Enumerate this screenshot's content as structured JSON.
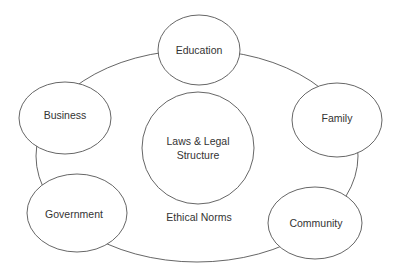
{
  "diagram": {
    "outer_label": "Ethical Norms",
    "center": {
      "line1": "Laws & Legal",
      "line2": "Structure"
    },
    "nodes": [
      {
        "label": "Education"
      },
      {
        "label": "Business"
      },
      {
        "label": "Family"
      },
      {
        "label": "Government"
      },
      {
        "label": "Community"
      }
    ]
  }
}
